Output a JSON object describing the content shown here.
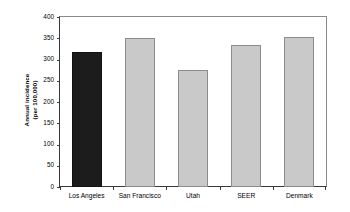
{
  "chart_data": {
    "type": "bar",
    "title": "",
    "subtitle": "",
    "xlabel": "",
    "ylabel_line1": "Annual incidence",
    "ylabel_line2": "(per 100,000)",
    "categories": [
      "Los Angeles",
      "San Francisco",
      "Utah",
      "SEER",
      "Denmark"
    ],
    "values": [
      317,
      350,
      275,
      333,
      352
    ],
    "series": [
      {
        "name": "Annual incidence (per 100,000)",
        "values": [
          317,
          350,
          275,
          333,
          352
        ]
      }
    ],
    "ylim": [
      0,
      400
    ],
    "yticks": [
      0,
      50,
      100,
      150,
      200,
      250,
      300,
      350,
      400
    ],
    "ytick_labels": [
      "0",
      "50",
      "100",
      "150",
      "200",
      "250",
      "300",
      "350",
      "400"
    ],
    "grid": false,
    "legend": "none",
    "bar_colors": [
      "#1c1c1c",
      "#c9c9c9",
      "#c9c9c9",
      "#c9c9c9",
      "#c9c9c9"
    ],
    "bar_border_colors": [
      "#111111",
      "#8c8c8c",
      "#8c8c8c",
      "#8c8c8c",
      "#8c8c8c"
    ],
    "highlight_color": "#1c1c1c",
    "default_bar_color": "#c9c9c9",
    "axis_color": "#3a3a3a",
    "frame_color": "#8a8a8a",
    "background_color": "#ffffff"
  }
}
